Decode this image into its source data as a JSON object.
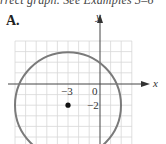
{
  "caption_partial": "rrect graph. See Examples 3–6",
  "option": {
    "label": "A."
  },
  "graph": {
    "x_axis_label": "x",
    "y_axis_label": "y",
    "tick_labels": {
      "x": "−3",
      "origin": "0",
      "y": "−2"
    },
    "circle": {
      "center": [
        -3,
        -2
      ],
      "radius": 5
    },
    "colors": {
      "circle": "#7a7a7a",
      "grid": "#d8d8d8",
      "axis": "#444444",
      "dot": "#111111"
    }
  }
}
